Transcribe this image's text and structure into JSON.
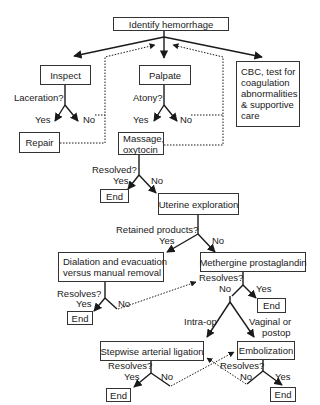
{
  "diagram": {
    "type": "flowchart",
    "nodes": {
      "identify": "Identify hemorrhage",
      "inspect": "Inspect",
      "palpate": "Palpate",
      "cbc": [
        "CBC, test for",
        "coagulation",
        "abnormalities",
        "& supportive",
        "care"
      ],
      "repair": "Repair",
      "massage": [
        "Massage,",
        "oxytocin"
      ],
      "end1": "End",
      "uterine": "Uterine exploration",
      "dialation": [
        "Dialation and evacuation",
        "versus manual removal"
      ],
      "methergine": "Methergine prostaglandin",
      "end2": "End",
      "end3": "End",
      "stepwise": "Stepwise arterial ligation",
      "embolization": "Embolization",
      "end4": "End",
      "end5": "End"
    },
    "labels": {
      "laceration": "Laceration?",
      "inspect_yes": "Yes",
      "inspect_no": "No",
      "atony": "Atony?",
      "palpate_yes": "Yes",
      "palpate_no": "No",
      "resolved": "Resolved?",
      "resolved_yes": "Yes",
      "resolved_no": "No",
      "retained": "Retained products?",
      "retained_yes": "Yes",
      "retained_no": "No",
      "dial_resolves": "Resolves?",
      "dial_yes": "Yes",
      "dial_no": "No",
      "meth_resolves": "Resolves?",
      "meth_no": "No",
      "meth_yes": "Yes",
      "intraop": "Intra-op",
      "vaginal1": "Vaginal or",
      "vaginal2": "postop",
      "step_resolves": "Resolves?",
      "step_yes": "Yes",
      "step_no": "No",
      "emb_resolves": "Resolves?",
      "emb_no": "No",
      "emb_yes": "Yes"
    }
  }
}
